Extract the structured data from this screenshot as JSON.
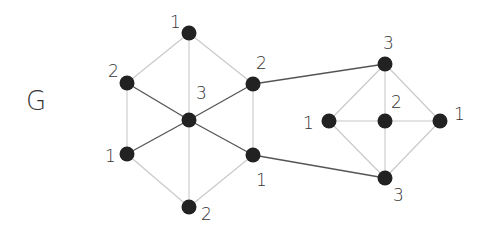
{
  "title": "G",
  "colors": {
    "node": "#222222",
    "edge_light": "#c8c8c8",
    "edge_dark": "#555555",
    "label": "#333333"
  },
  "nodes": [
    {
      "id": "h_top",
      "x": 189,
      "y": 33,
      "label": "1",
      "lx": 170,
      "ly": 28
    },
    {
      "id": "h_ul",
      "x": 127,
      "y": 83,
      "label": "2",
      "lx": 108,
      "ly": 77
    },
    {
      "id": "h_ur",
      "x": 253,
      "y": 84,
      "label": "2",
      "lx": 256,
      "ly": 69
    },
    {
      "id": "h_c",
      "x": 189,
      "y": 120,
      "label": "3",
      "lx": 196,
      "ly": 99
    },
    {
      "id": "h_ll",
      "x": 127,
      "y": 154,
      "label": "1",
      "lx": 105,
      "ly": 162
    },
    {
      "id": "h_lr",
      "x": 253,
      "y": 155,
      "label": "1",
      "lx": 256,
      "ly": 186
    },
    {
      "id": "h_bot",
      "x": 189,
      "y": 207,
      "label": "2",
      "lx": 201,
      "ly": 220
    },
    {
      "id": "d_top",
      "x": 385,
      "y": 64,
      "label": "3",
      "lx": 383,
      "ly": 49
    },
    {
      "id": "d_l",
      "x": 329,
      "y": 121,
      "label": "1",
      "lx": 303,
      "ly": 129
    },
    {
      "id": "d_c",
      "x": 385,
      "y": 121,
      "label": "2",
      "lx": 391,
      "ly": 108
    },
    {
      "id": "d_r",
      "x": 440,
      "y": 121,
      "label": "1",
      "lx": 454,
      "ly": 120
    },
    {
      "id": "d_bot",
      "x": 385,
      "y": 178,
      "label": "3",
      "lx": 393,
      "ly": 201
    }
  ],
  "edges": [
    {
      "from": "h_top",
      "to": "h_ul",
      "style": "light"
    },
    {
      "from": "h_top",
      "to": "h_ur",
      "style": "light"
    },
    {
      "from": "h_top",
      "to": "h_c",
      "style": "light"
    },
    {
      "from": "h_ul",
      "to": "h_ll",
      "style": "light"
    },
    {
      "from": "h_ur",
      "to": "h_lr",
      "style": "light"
    },
    {
      "from": "h_ll",
      "to": "h_bot",
      "style": "light"
    },
    {
      "from": "h_lr",
      "to": "h_bot",
      "style": "light"
    },
    {
      "from": "h_c",
      "to": "h_bot",
      "style": "light"
    },
    {
      "from": "h_ul",
      "to": "h_c",
      "style": "dark"
    },
    {
      "from": "h_ur",
      "to": "h_c",
      "style": "dark"
    },
    {
      "from": "h_ll",
      "to": "h_c",
      "style": "dark"
    },
    {
      "from": "h_lr",
      "to": "h_c",
      "style": "dark"
    },
    {
      "from": "h_ur",
      "to": "d_top",
      "style": "dark"
    },
    {
      "from": "h_lr",
      "to": "d_bot",
      "style": "dark"
    },
    {
      "from": "d_top",
      "to": "d_l",
      "style": "light"
    },
    {
      "from": "d_top",
      "to": "d_r",
      "style": "light"
    },
    {
      "from": "d_top",
      "to": "d_c",
      "style": "light"
    },
    {
      "from": "d_bot",
      "to": "d_l",
      "style": "light"
    },
    {
      "from": "d_bot",
      "to": "d_r",
      "style": "light"
    },
    {
      "from": "d_bot",
      "to": "d_c",
      "style": "light"
    },
    {
      "from": "d_l",
      "to": "d_c",
      "style": "light"
    },
    {
      "from": "d_c",
      "to": "d_r",
      "style": "light"
    }
  ]
}
